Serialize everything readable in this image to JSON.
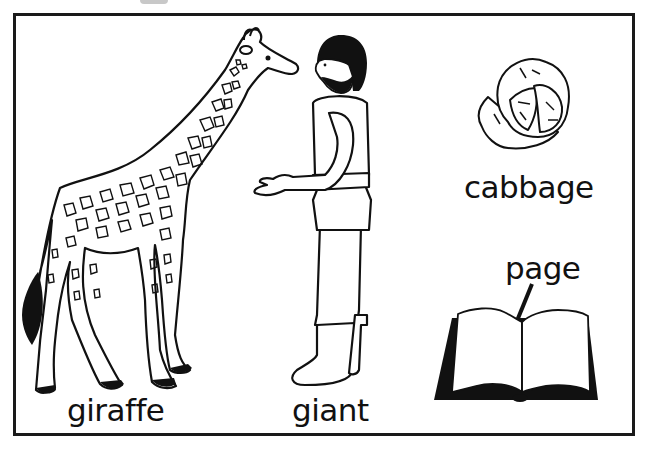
{
  "labels": {
    "giraffe": "giraffe",
    "giant": "giant",
    "cabbage": "cabbage",
    "page": "page"
  },
  "colors": {
    "ink": "#111111",
    "background": "#ffffff",
    "border": "#1a1a1a"
  },
  "illustrations": [
    {
      "name": "giraffe",
      "description": "line drawing of a spotted giraffe standing facing right"
    },
    {
      "name": "giant",
      "description": "bearded man in tunic and boots holding out a hand toward the giraffe"
    },
    {
      "name": "cabbage",
      "description": "line drawing of a cabbage head"
    },
    {
      "name": "page",
      "description": "open book with arrow pointing to a page"
    }
  ]
}
